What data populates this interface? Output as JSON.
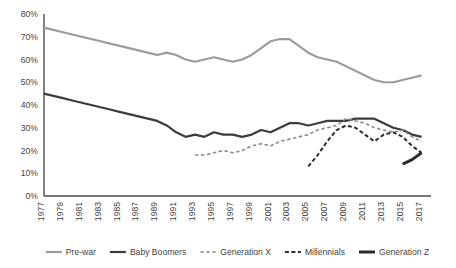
{
  "chart_data": {
    "type": "line",
    "title": "",
    "subtitle": "",
    "xlabel": "",
    "ylabel": "",
    "xlim": [
      1977,
      2018
    ],
    "ylim": [
      0,
      0.8
    ],
    "grid": false,
    "legend_position": "bottom",
    "y_tick_labels": [
      "80%",
      "70%",
      "60%",
      "50%",
      "40%",
      "30%",
      "20%",
      "10%",
      "0%"
    ],
    "y_tick_values": [
      80,
      70,
      60,
      50,
      40,
      30,
      20,
      10,
      0
    ],
    "x_tick_labels": [
      "1977",
      "1979",
      "1981",
      "1983",
      "1985",
      "1987",
      "1989",
      "1991",
      "1993",
      "1995",
      "1997",
      "1999",
      "2001",
      "2003",
      "2005",
      "2007",
      "2009",
      "2011",
      "2013",
      "2015",
      "2017"
    ],
    "x_tick_values": [
      1977,
      1979,
      1981,
      1983,
      1985,
      1987,
      1989,
      1991,
      1993,
      1995,
      1997,
      1999,
      2001,
      2003,
      2005,
      2007,
      2009,
      2011,
      2013,
      2015,
      2017
    ],
    "series": [
      {
        "name": "Pre-war",
        "color": "#9b9b9b",
        "style": "solid",
        "width": 2.2,
        "x": [
          1977,
          1978,
          1979,
          1980,
          1981,
          1982,
          1983,
          1984,
          1985,
          1986,
          1987,
          1988,
          1989,
          1990,
          1991,
          1992,
          1993,
          1994,
          1995,
          1996,
          1997,
          1998,
          1999,
          2000,
          2001,
          2002,
          2003,
          2004,
          2005,
          2006,
          2007,
          2008,
          2009,
          2010,
          2011,
          2012,
          2013,
          2014,
          2015,
          2016,
          2017
        ],
        "values": [
          74,
          73,
          72,
          71,
          70,
          69,
          68,
          67,
          66,
          65,
          64,
          63,
          62,
          63,
          62,
          60,
          59,
          60,
          61,
          60,
          59,
          60,
          62,
          65,
          68,
          69,
          69,
          66,
          63,
          61,
          60,
          59,
          57,
          55,
          53,
          51,
          50,
          50,
          51,
          52,
          53
        ]
      },
      {
        "name": "Baby Boomers",
        "color": "#3c3c3c",
        "style": "solid",
        "width": 2.2,
        "x": [
          1977,
          1978,
          1979,
          1980,
          1981,
          1982,
          1983,
          1984,
          1985,
          1986,
          1987,
          1988,
          1989,
          1990,
          1991,
          1992,
          1993,
          1994,
          1995,
          1996,
          1997,
          1998,
          1999,
          2000,
          2001,
          2002,
          2003,
          2004,
          2005,
          2006,
          2007,
          2008,
          2009,
          2010,
          2011,
          2012,
          2013,
          2014,
          2015,
          2016,
          2017
        ],
        "values": [
          45,
          44,
          43,
          42,
          41,
          40,
          39,
          38,
          37,
          36,
          35,
          34,
          33,
          31,
          28,
          26,
          27,
          26,
          28,
          27,
          27,
          26,
          27,
          29,
          28,
          30,
          32,
          32,
          31,
          32,
          33,
          33,
          33,
          34,
          34,
          34,
          32,
          30,
          29,
          27,
          26
        ]
      },
      {
        "name": "Generation X",
        "color": "#8a8a8a",
        "style": "dashed",
        "width": 1.6,
        "x": [
          1993,
          1994,
          1995,
          1996,
          1997,
          1998,
          1999,
          2000,
          2001,
          2002,
          2003,
          2004,
          2005,
          2006,
          2007,
          2008,
          2009,
          2010,
          2011,
          2012,
          2013,
          2014,
          2015,
          2016,
          2017
        ],
        "values": [
          18,
          18,
          19,
          20,
          19,
          20,
          22,
          23,
          22,
          24,
          25,
          26,
          27,
          29,
          30,
          31,
          34,
          33,
          32,
          30,
          29,
          28,
          29,
          26,
          24
        ]
      },
      {
        "name": "Millennials",
        "color": "#2e2e2e",
        "style": "dashed",
        "width": 2.0,
        "x": [
          2005,
          2006,
          2007,
          2008,
          2009,
          2010,
          2011,
          2012,
          2013,
          2014,
          2015,
          2016,
          2017
        ],
        "values": [
          13,
          18,
          24,
          29,
          31,
          30,
          27,
          24,
          27,
          28,
          26,
          22,
          19
        ]
      },
      {
        "name": "Generation Z",
        "color": "#2b2b2b",
        "style": "solid",
        "width": 3.0,
        "x": [
          2015,
          2016,
          2017
        ],
        "values": [
          14,
          16,
          19
        ]
      }
    ]
  },
  "legend": {
    "items": [
      {
        "label": "Pre-war"
      },
      {
        "label": "Baby Boomers"
      },
      {
        "label": "Generation X"
      },
      {
        "label": "Millennials"
      },
      {
        "label": "Generation Z"
      }
    ]
  }
}
